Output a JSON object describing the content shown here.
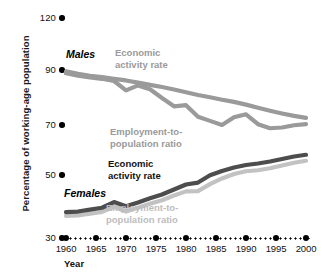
{
  "chart_data": {
    "type": "line",
    "title": "",
    "xlabel": "Year",
    "ylabel": "Percentage of working-age population",
    "x": [
      1960,
      1962,
      1964,
      1966,
      1968,
      1970,
      1972,
      1974,
      1976,
      1978,
      1980,
      1982,
      1984,
      1986,
      1988,
      1990,
      1992,
      1994,
      1996,
      1998,
      2000
    ],
    "xticks": [
      "1960",
      "1965",
      "1970",
      "1975",
      "1980",
      "1985",
      "1990",
      "1995",
      "2000"
    ],
    "yticks": [
      "120",
      "90",
      "70",
      "50",
      "30"
    ],
    "ylim": [
      30,
      120
    ],
    "grid": false,
    "legend_position": "inline-annotations",
    "annotations": [
      {
        "name": "males-group",
        "text": "Males"
      },
      {
        "name": "females-group",
        "text": "Females"
      },
      {
        "name": "males-economic-activity-rate",
        "text": "Economic activity rate"
      },
      {
        "name": "males-employment-to-population-ratio",
        "text": "Employment-to-population ratio"
      },
      {
        "name": "females-economic-activity-rate",
        "text": "Economic activity rate"
      },
      {
        "name": "females-employment-to-population-ratio",
        "text": "Employment-to-population ratio"
      }
    ],
    "series": [
      {
        "name": "Males economic activity rate",
        "color": "#9a9a9a",
        "values": [
          89.5,
          88.6,
          87.9,
          87.4,
          86.8,
          86.2,
          85.4,
          84.6,
          83.8,
          82.9,
          81.9,
          80.9,
          80.1,
          79.2,
          78.4,
          77.4,
          76.3,
          75.2,
          74.2,
          73.3,
          72.6
        ]
      },
      {
        "name": "Males employment-to-population ratio",
        "color": "#9a9a9a",
        "values": [
          88.8,
          87.9,
          87.3,
          86.8,
          86.0,
          82.6,
          84.4,
          83.0,
          79.8,
          76.8,
          77.2,
          73.0,
          71.5,
          70.0,
          72.8,
          73.9,
          70.3,
          68.7,
          69.0,
          69.9,
          70.3
        ]
      },
      {
        "name": "Females economic activity rate",
        "color": "#4d4d4d",
        "values": [
          38.2,
          38.4,
          39.0,
          39.6,
          41.4,
          40.1,
          41.3,
          42.6,
          43.8,
          45.4,
          47.0,
          47.6,
          49.9,
          51.6,
          53.0,
          54.0,
          54.6,
          55.4,
          56.4,
          57.4,
          58.1
        ]
      },
      {
        "name": "Females employment-to-population ratio",
        "color": "#c2c2c2",
        "values": [
          37.0,
          37.2,
          37.7,
          38.3,
          39.9,
          38.4,
          39.6,
          40.9,
          42.0,
          43.5,
          44.8,
          44.9,
          47.1,
          48.9,
          50.4,
          51.5,
          51.9,
          52.7,
          53.8,
          54.9,
          55.7
        ]
      }
    ]
  },
  "axis": {
    "y_title": "Percentage of working-age population",
    "x_title": "Year",
    "y_ticks": [
      {
        "label": "120",
        "y": 18
      },
      {
        "label": "90",
        "y": 70
      },
      {
        "label": "70",
        "y": 125
      },
      {
        "label": "50",
        "y": 175
      },
      {
        "label": "30",
        "y": 238
      }
    ],
    "x_ticks": [
      {
        "label": "1960",
        "x": 66
      },
      {
        "label": "1965",
        "x": 96
      },
      {
        "label": "1970",
        "x": 126
      },
      {
        "label": "1975",
        "x": 156
      },
      {
        "label": "1980",
        "x": 186
      },
      {
        "label": "1985",
        "x": 216
      },
      {
        "label": "1990",
        "x": 246
      },
      {
        "label": "1995",
        "x": 276
      },
      {
        "label": "2000",
        "x": 306
      }
    ]
  },
  "labels": {
    "males_group": "Males",
    "females_group": "Females",
    "males_economic": "Economic\nactivity rate",
    "males_economic_line1": "Economic",
    "males_economic_line2": "activity rate",
    "males_employment_line1": "Employment-to-",
    "males_employment_line2": "population ratio",
    "females_economic_line1": "Economic",
    "females_economic_line2": "activity rate",
    "females_employment_line1": "Employment-to-",
    "females_employment_line2": "population ratio"
  },
  "colors": {
    "males_ear": "#9a9a9a",
    "males_epr": "#9a9a9a",
    "females_ear": "#4d4d4d",
    "females_epr": "#c2c2c2",
    "axis": "#000000",
    "background": "#ffffff"
  }
}
